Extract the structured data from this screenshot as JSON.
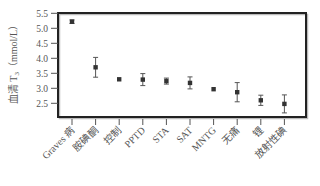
{
  "chart_data": {
    "type": "scatter",
    "subtype": "mean-with-error-bars",
    "title": "",
    "xlabel": "",
    "ylabel": "血清 T3（mmol/L）",
    "ylabel_parts": {
      "prefix": "血清 T",
      "subscript": "3",
      "suffix": "（mmol/L）"
    },
    "ylim": [
      2.25,
      5.5
    ],
    "yticks": [
      2.5,
      3.0,
      3.5,
      4.0,
      4.5,
      5.0,
      5.5
    ],
    "ytick_labels": [
      "2.5",
      "3.0",
      "3.5",
      "4.0",
      "4.5",
      "5.0",
      "5.5"
    ],
    "grid": false,
    "legend": null,
    "categories": [
      "Graves 病",
      "胺碘酮",
      "控制",
      "PPTD",
      "STA",
      "SAT",
      "MNTG",
      "无痛",
      "锂",
      "放射性碘"
    ],
    "values": [
      5.22,
      3.7,
      3.3,
      3.29,
      3.24,
      3.18,
      2.97,
      2.87,
      2.6,
      2.48
    ],
    "errors": [
      0.06,
      0.33,
      0.03,
      0.2,
      0.1,
      0.2,
      0.03,
      0.32,
      0.17,
      0.3
    ],
    "colors": {
      "marker": "#333333",
      "errorbar": "#555555",
      "frame": "#222222",
      "text": "#555555"
    }
  }
}
